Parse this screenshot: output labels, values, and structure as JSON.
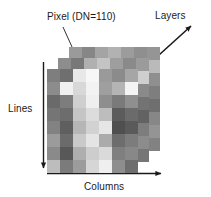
{
  "figure": {
    "title_visible": false,
    "background": "#ffffff",
    "ink_color": "#1a1a1a"
  },
  "labels": {
    "pixel": "Pixel (DN=110)",
    "layers": "Layers",
    "lines": "Lines",
    "columns": "Columns"
  },
  "axes": {
    "lines": {
      "name": "lines-axis-arrow",
      "direction": "down",
      "label": "Lines"
    },
    "columns": {
      "name": "columns-axis-arrow",
      "direction": "right",
      "label": "Columns"
    },
    "layers": {
      "name": "layers-axis-arrow",
      "direction": "up-right",
      "label": "Layers"
    }
  },
  "callout": {
    "label": "Pixel (DN=110)",
    "dn_value": 110,
    "marker": "triangle-marker",
    "target_layer": 0,
    "target_column": 1,
    "target_row": 0
  },
  "cube": {
    "layer_count": 3,
    "columns": 7,
    "rows": 8,
    "cell_width": 13,
    "cell_height": 13,
    "layer_offset_x": 11,
    "layer_offset_y": -11,
    "front_origin_x": 47,
    "front_origin_y": 69,
    "layers": [
      {
        "name": "front-layer",
        "index": 0,
        "pixels": [
          [
            "#7e7e7e",
            "#6f6f6f",
            "#e8e8e8",
            "#f7f7f7",
            "#9a9a9a",
            "#8b8b8b",
            "#a6a6a6"
          ],
          [
            "#8c8c8c",
            "#f0f0f0",
            "#d8d8d8",
            "#f2f2f2",
            "#9f9f9f",
            "#b4b4b4",
            "#f4f4f4"
          ],
          [
            "#6a6a6a",
            "#7d7d7d",
            "#cfcfcf",
            "#efefef",
            "#8e8e8e",
            "#7a7a7a",
            "#8f8f8f"
          ],
          [
            "#757575",
            "#6d6d6d",
            "#c5c5c5",
            "#dcdcdc",
            "#bdbdbd",
            "#5c5c5c",
            "#6b6b6b"
          ],
          [
            "#828282",
            "#5f5f5f",
            "#b6b6b6",
            "#d2d2d2",
            "#e6e6e6",
            "#4f4f4f",
            "#5a5a5a"
          ],
          [
            "#9b9b9b",
            "#6b6b6b",
            "#c9c9c9",
            "#e4e4e4",
            "#ababab",
            "#6d6d6d",
            "#7c7c7c"
          ],
          [
            "#8a8a8a",
            "#585858",
            "#aeaeae",
            "#cdcdcd",
            "#dadada",
            "#7f7f7f",
            "#888888"
          ],
          [
            "#bdbdbd",
            "#7b7b7b",
            "#9c9c9c",
            "#d6d6d6",
            "#efefef",
            "#8e8e8e",
            "#6e6e6e"
          ]
        ]
      },
      {
        "name": "middle-layer",
        "index": 1,
        "pixels": [
          [
            "#8d8d8d",
            "#787878",
            "#b0b0b0",
            "#c4c4c4",
            "#9e9e9e",
            "#8a8a8a",
            "#9b9b9b"
          ],
          [
            "#7a7a7a",
            "#c6c6c6",
            "#e2e2e2",
            "#b8b8b8",
            "#8f8f8f",
            "#a3a3a3",
            "#cfcfcf"
          ],
          [
            "#6e6e6e",
            "#848484",
            "#b5b5b5",
            "#d0d0d0",
            "#959595",
            "#7e7e7e",
            "#8a8a8a"
          ],
          [
            "#80808 0",
            "#6f6f6f",
            "#a9a9a9",
            "#c2c2c2",
            "#b0b0b0",
            "#656565",
            "#737373"
          ],
          [
            "#8b8b8b",
            "#646464",
            "#9f9f9f",
            "#bbbbbb",
            "#cccccc",
            "#585858",
            "#626262"
          ],
          [
            "#9a9a9a",
            "#747474",
            "#b2b2b2",
            "#cacaca",
            "#a4a4a4",
            "#6f6f6f",
            "#7d7d7d"
          ],
          [
            "#868686",
            "#5f5f5f",
            "#9d9d9d",
            "#b6b6b6",
            "#c0c0c0",
            "#828282",
            "#8c8c8c"
          ],
          [
            "#aeaeae",
            "#808080",
            "#949494",
            "#bebebe",
            "#d2d2d2",
            "#909090",
            "#767676"
          ]
        ]
      },
      {
        "name": "back-layer",
        "index": 2,
        "pixels": [
          [
            "#9a9a9a",
            "#868686",
            "#a4a4a4",
            "#b2b2b2",
            "#9c9c9c",
            "#8f8f8f",
            "#959595"
          ],
          [
            "#848484",
            "#b4b4b4",
            "#c8c8c8",
            "#aeaeae",
            "#939393",
            "#9f9f9f",
            "#bababa"
          ],
          [
            "#7b7b7b",
            "#8d8d8d",
            "#a8a8a8",
            "#bdbdbd",
            "#989898",
            "#868686",
            "#8f8f8f"
          ],
          [
            "#8a8a8a",
            "#7c7c7c",
            "#a0a0a0",
            "#b4b4b4",
            "#a8a8a8",
            "#727272",
            "#7e7e7e"
          ],
          [
            "#939393",
            "#707070",
            "#989898",
            "#afafaf",
            "#bcbcbc",
            "#666666",
            "#6f6f6f"
          ],
          [
            "#a0a0a0",
            "#808080",
            "#a8a8a8",
            "#bababa",
            "#a0a0a0",
            "#7b7b7b",
            "#878787"
          ],
          [
            "#8f8f8f",
            "#6c6c6c",
            "#969696",
            "#acacac",
            "#b4b4b4",
            "#8b8b8b",
            "#949494"
          ],
          [
            "#a8a8a8",
            "#8a8a8a",
            "#9a9a9a",
            "#b4b4b4",
            "#c4c4c4",
            "#999999",
            "#828282"
          ]
        ]
      }
    ]
  }
}
